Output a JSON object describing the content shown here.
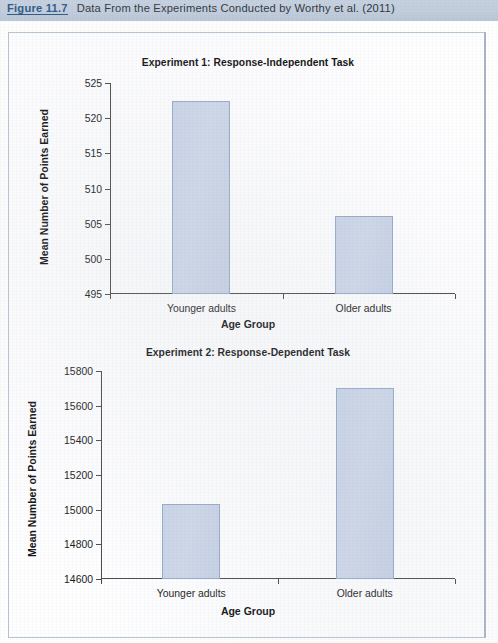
{
  "caption": {
    "label": "Figure 11.7",
    "text": "Data From the Experiments Conducted by Worthy et al. (2011)"
  },
  "colors": {
    "caption_bar": "#c1cddc",
    "caption_label": "#2f5a86",
    "bar_fill": "#ccd6e8",
    "bar_border": "#93aaca",
    "axis": "#4a4a4a",
    "frame_border": "#b9c4d3"
  },
  "chart_data": [
    {
      "type": "bar",
      "title": "Experiment 1: Response-Independent Task",
      "xlabel": "Age Group",
      "ylabel": "Mean Number of Points Earned",
      "categories": [
        "Younger adults",
        "Older adults"
      ],
      "values": [
        522.4,
        506.1
      ],
      "ylim": [
        495,
        525
      ],
      "yticks": [
        495,
        500,
        505,
        510,
        515,
        520,
        525
      ],
      "ytick_labels": [
        "495",
        "500",
        "505",
        "510",
        "515",
        "520",
        "525"
      ],
      "grid": false,
      "legend": "none"
    },
    {
      "type": "bar",
      "title": "Experiment 2: Response-Dependent Task",
      "xlabel": "Age Group",
      "ylabel": "Mean Number of Points Earned",
      "categories": [
        "Younger adults",
        "Older adults"
      ],
      "values": [
        15030,
        15700
      ],
      "ylim": [
        14600,
        15800
      ],
      "yticks": [
        14600,
        14800,
        15000,
        15200,
        15400,
        15600,
        15800
      ],
      "ytick_labels": [
        "14600",
        "14800",
        "15000",
        "15200",
        "15400",
        "15600",
        "15800"
      ],
      "grid": false,
      "legend": "none"
    }
  ]
}
